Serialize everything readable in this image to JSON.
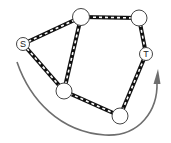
{
  "diagram": {
    "colors": {
      "edge_outer": "#111111",
      "edge_dash": "#ffffff",
      "node_fill": "#ffffff",
      "node_stroke": "#444444",
      "arrow": "#6e6e6e"
    },
    "nodes": [
      {
        "id": "S",
        "label": "S",
        "x": 23,
        "y": 44,
        "r": 6.5
      },
      {
        "id": "A",
        "label": "",
        "x": 81,
        "y": 17,
        "r": 8.5
      },
      {
        "id": "B",
        "label": "",
        "x": 139,
        "y": 18,
        "r": 8
      },
      {
        "id": "T",
        "label": "T",
        "x": 146,
        "y": 54,
        "r": 6.5
      },
      {
        "id": "C",
        "label": "",
        "x": 64,
        "y": 91,
        "r": 8
      },
      {
        "id": "D",
        "label": "",
        "x": 120,
        "y": 116,
        "r": 8
      }
    ],
    "edges": [
      {
        "from": "S",
        "to": "A"
      },
      {
        "from": "A",
        "to": "B"
      },
      {
        "from": "B",
        "to": "T"
      },
      {
        "from": "S",
        "to": "C"
      },
      {
        "from": "A",
        "to": "C"
      },
      {
        "from": "C",
        "to": "D"
      },
      {
        "from": "D",
        "to": "T"
      }
    ],
    "arrow": {
      "path": "M17,62 C30,100 60,132 105,135 C140,137 158,110 157,82",
      "direction": "clockwise under graph toward T"
    }
  }
}
